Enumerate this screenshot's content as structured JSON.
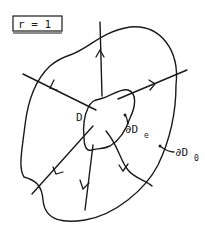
{
  "diagram": {
    "parameter_box": {
      "text": "r = 1"
    },
    "labels": {
      "region": "D",
      "inner_boundary": {
        "base": "∂D",
        "sub": "e"
      },
      "outer_boundary": {
        "base": "∂D",
        "sub": "0"
      }
    },
    "rays": [
      {
        "id": "up",
        "direction": "outward"
      },
      {
        "id": "upper-right",
        "direction": "outward"
      },
      {
        "id": "upper-left",
        "direction": "outward"
      },
      {
        "id": "lower-left",
        "direction": "outward"
      },
      {
        "id": "down",
        "direction": "outward"
      },
      {
        "id": "lower-right",
        "direction": "outward"
      }
    ],
    "colors": {
      "ink": "#1a1a1a",
      "background": "#ffffff"
    }
  }
}
